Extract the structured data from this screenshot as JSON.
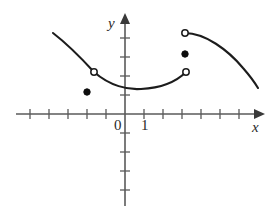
{
  "figure": {
    "kind": "cartesian-graph"
  },
  "axes": {
    "x_label": "x",
    "y_label": "x-unused",
    "y_axis_label": "y",
    "origin_label": "0",
    "unit_label": "1",
    "x_axis_y_px": 114,
    "y_axis_x_px": 125,
    "tick_spacing_px": 19,
    "x_ticks_left": 5,
    "x_ticks_right": 7,
    "y_ticks_up": 5,
    "y_ticks_down": 5,
    "tick_half_len_px": 5,
    "x_min_px": 16,
    "x_max_px": 262,
    "y_min_px": 206,
    "y_max_px": 16
  },
  "colors": {
    "axis": "#5a5a5a",
    "curve": "#1c1c1c",
    "point_fill": "#0d0d0d",
    "point_open_fill": "#ffffff",
    "background": "#ffffff",
    "text": "#2a2a2a"
  },
  "chart_data": {
    "type": "line",
    "title": "",
    "xlabel": "x",
    "ylabel": "y",
    "grid": false,
    "legend": "none",
    "xlim": [
      -5.7,
      7.2
    ],
    "ylim": [
      -4.8,
      5.2
    ],
    "note": "Coordinates given in graph units where origin is (0,0) and one tick = 1 unit.",
    "series": [
      {
        "name": "left-branch",
        "style": "solid-curve",
        "path_px": "M 53,33 C 66,43 83,60 94,72",
        "points_units": [
          [
            -3.8,
            4.3
          ],
          [
            -1.6,
            2.2
          ]
        ],
        "start_endpoint": "none",
        "end_endpoint": "open"
      },
      {
        "name": "middle-branch",
        "style": "solid-curve",
        "path_px": "M 94,72 C 110,86 128,90 141,89 C 160,88 176,82 186,72",
        "points_units": [
          [
            -1.6,
            2.2
          ],
          [
            0.8,
            1.3
          ],
          [
            3.2,
            2.2
          ]
        ],
        "start_endpoint": "open",
        "end_endpoint": "open"
      },
      {
        "name": "right-branch",
        "style": "solid-curve",
        "path_px": "M 185,33 C 205,33 228,50 243,68 C 250,76 255,83 258,88",
        "points_units": [
          [
            3.2,
            4.3
          ],
          [
            7.0,
            1.4
          ]
        ],
        "start_endpoint": "open",
        "end_endpoint": "none"
      }
    ],
    "open_points": [
      {
        "name": "open-left-mid",
        "px": [
          94,
          72
        ],
        "units": [
          -1.6,
          2.2
        ]
      },
      {
        "name": "open-right-low",
        "px": [
          186,
          72
        ],
        "units": [
          3.2,
          2.2
        ]
      },
      {
        "name": "open-right-high",
        "px": [
          185,
          33
        ],
        "units": [
          3.2,
          4.3
        ]
      }
    ],
    "closed_points": [
      {
        "name": "closed-left",
        "px": [
          87,
          92
        ],
        "units": [
          -2.0,
          1.2
        ]
      },
      {
        "name": "closed-right",
        "px": [
          185,
          54
        ],
        "units": [
          3.2,
          3.2
        ]
      }
    ]
  }
}
